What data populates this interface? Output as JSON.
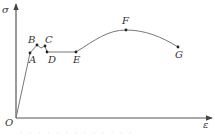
{
  "diagram": {
    "type": "stress-strain curve",
    "axes": {
      "y_label": "σ",
      "x_label": "ε",
      "origin_label": "O"
    },
    "points": [
      {
        "label": "A",
        "x": 30,
        "y": 53,
        "lx": 29,
        "ly": 63
      },
      {
        "label": "B",
        "x": 37,
        "y": 45,
        "lx": 28,
        "ly": 43
      },
      {
        "label": "C",
        "x": 45,
        "y": 46,
        "lx": 45,
        "ly": 43
      },
      {
        "label": "D",
        "x": 47,
        "y": 52,
        "lx": 48,
        "ly": 63
      },
      {
        "label": "E",
        "x": 76,
        "y": 52,
        "lx": 73,
        "ly": 63
      },
      {
        "label": "F",
        "x": 126,
        "y": 30,
        "lx": 122,
        "ly": 24
      },
      {
        "label": "G",
        "x": 178,
        "y": 47,
        "lx": 175,
        "ly": 58
      }
    ],
    "stages": [
      "elastic (O–A)",
      "yield (B–C–D)",
      "plateau (D–E)",
      "strain hardening (E–F)",
      "necking (F–G)"
    ],
    "caption": "· · · · · · · · · · · · ·"
  }
}
